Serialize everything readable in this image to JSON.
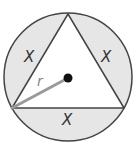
{
  "diagram": {
    "colors": {
      "background": "#ffffff",
      "shade": "#e6e6e6",
      "stroke": "#444444",
      "radius_line": "#9a9a9a",
      "center_dot": "#111111"
    },
    "labels": {
      "segment_left": "X",
      "segment_right": "X",
      "segment_bottom": "X",
      "radius": "r"
    }
  }
}
